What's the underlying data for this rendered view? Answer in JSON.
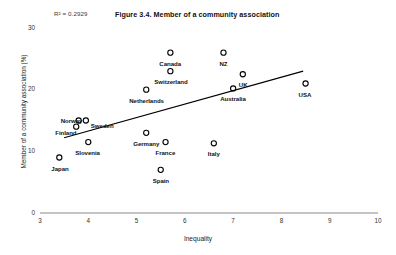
{
  "figure": {
    "title": "Figure 3.4. Member of a community association",
    "r2_note": "R² = 0.2929"
  },
  "axes": {
    "x_title": "Inequality",
    "y_title": "Member of a community association (%)",
    "x_ticks": [
      "3",
      "4",
      "5",
      "6",
      "7",
      "8",
      "9",
      "10"
    ],
    "y_ticks": [
      "30",
      "20",
      "10",
      "0"
    ]
  },
  "chart_data": {
    "type": "scatter",
    "title": "Figure 3.4. Member of a community association",
    "xlabel": "Inequality",
    "ylabel": "Member of a community association (%)",
    "xlim": [
      3,
      10
    ],
    "ylim": [
      0,
      30
    ],
    "xticks": [
      3,
      4,
      5,
      6,
      7,
      8,
      9,
      10
    ],
    "yticks": [
      0,
      10,
      20,
      30
    ],
    "grid": false,
    "legend": false,
    "annotations": [
      "R² = 0.2929"
    ],
    "r_squared": 0.2929,
    "marker": "open-circle",
    "points": [
      {
        "label": "Canada",
        "x": 5.7,
        "y": 26.0,
        "lx": -11,
        "ly": 8
      },
      {
        "label": "NZ",
        "x": 6.8,
        "y": 26.0,
        "lx": -4,
        "ly": 8
      },
      {
        "label": "Switzerland",
        "x": 5.7,
        "y": 23.0,
        "lx": -16,
        "ly": 8
      },
      {
        "label": "UK",
        "x": 7.2,
        "y": 22.5,
        "lx": -4,
        "ly": 8
      },
      {
        "label": "Netherlands",
        "x": 5.2,
        "y": 20.0,
        "lx": -17,
        "ly": 8
      },
      {
        "label": "Australia",
        "x": 7.0,
        "y": 20.2,
        "lx": -13,
        "ly": 8
      },
      {
        "label": "USA",
        "x": 8.5,
        "y": 21.0,
        "lx": -7,
        "ly": 8
      },
      {
        "label": "Norway",
        "x": 3.8,
        "y": 15.0,
        "lx": -18,
        "ly": -3
      },
      {
        "label": "Sweden",
        "x": 3.95,
        "y": 15.0,
        "lx": 5,
        "ly": 2
      },
      {
        "label": "Finland",
        "x": 3.75,
        "y": 14.0,
        "lx": -21,
        "ly": 3
      },
      {
        "label": "Slovenia",
        "x": 4.0,
        "y": 11.5,
        "lx": -13,
        "ly": 8
      },
      {
        "label": "Germany",
        "x": 5.2,
        "y": 13.0,
        "lx": -13,
        "ly": 8
      },
      {
        "label": "France",
        "x": 5.6,
        "y": 11.5,
        "lx": -10,
        "ly": 8
      },
      {
        "label": "Italy",
        "x": 6.6,
        "y": 11.3,
        "lx": -6,
        "ly": 8
      },
      {
        "label": "Japan",
        "x": 3.4,
        "y": 9.0,
        "lx": -8,
        "ly": 8
      },
      {
        "label": "Spain",
        "x": 5.5,
        "y": 7.0,
        "lx": -8,
        "ly": 8
      }
    ],
    "trendline": {
      "x0": 3.5,
      "y0": 12.2,
      "x1": 8.45,
      "y1": 23.0
    }
  },
  "colors": {
    "axis": "#808080",
    "marker_stroke": "#000000",
    "trendline": "#000000",
    "text": "#111111"
  }
}
